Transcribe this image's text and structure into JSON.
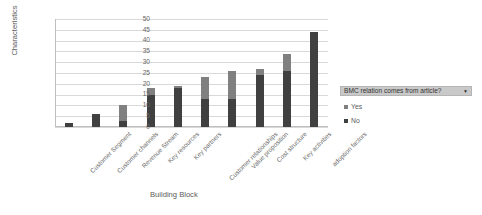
{
  "chart_data": {
    "type": "bar",
    "subtype": "stacked-column",
    "title": "",
    "xlabel": "Building Block",
    "ylabel": "Characteristics",
    "ylim": [
      0,
      50
    ],
    "ytick_step": 5,
    "yticks": [
      0,
      5,
      10,
      15,
      20,
      25,
      30,
      35,
      40,
      45,
      50
    ],
    "grid": true,
    "legend_position": "right",
    "categories": [
      "Customer Segment",
      "Customer channels",
      "Revenue Stream",
      "Key resources",
      "Key partners",
      "Customer relationships",
      "Value proposition",
      "Cost structure",
      "Key activities",
      "adoption factors"
    ],
    "series": [
      {
        "name": "No",
        "color": "#404040",
        "values": [
          2,
          6,
          3,
          15,
          18,
          13,
          13,
          24,
          26,
          44
        ]
      },
      {
        "name": "Yes",
        "color": "#808080",
        "values": [
          0,
          0,
          7,
          3,
          1,
          10,
          13,
          3,
          8,
          0
        ]
      }
    ],
    "totals": [
      2,
      6,
      10,
      18,
      19,
      23,
      26,
      27,
      34,
      44
    ]
  },
  "legend": {
    "title": "BMC relation comes from article?",
    "caret": "▼",
    "items": [
      {
        "label": "Yes"
      },
      {
        "label": "No"
      }
    ]
  },
  "axes": {
    "y_title": "Characteristics",
    "x_title": "Building Block"
  }
}
